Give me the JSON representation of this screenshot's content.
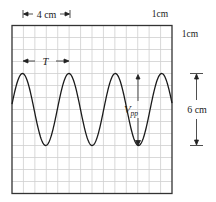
{
  "figure": {
    "type": "oscilloscope-trace",
    "labels": {
      "horizontal_scale": "4 cm",
      "grid_x_unit": "1cm",
      "grid_y_unit": "1cm",
      "period": "T",
      "vpp_main": "V",
      "vpp_sub": "pp",
      "amplitude_height": "6 cm"
    },
    "grid": {
      "cols": 14,
      "rows": 14,
      "cell_cm": 1
    },
    "waveform": {
      "shape": "sine",
      "period_cm": 4,
      "peak_to_peak_cm": 6,
      "cycles_visible": 3.5
    },
    "colors": {
      "grid": "#c8c8c8",
      "frame": "#333333",
      "trace": "#1a1a1a",
      "annotation": "#222222"
    }
  }
}
